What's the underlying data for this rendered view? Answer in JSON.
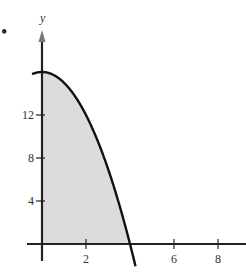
{
  "marker": "•",
  "chart_data": {
    "type": "area",
    "title": "",
    "function": "y = 16 - x^2",
    "xlabel": "",
    "ylabel": "y",
    "xlim": [
      0,
      9.2
    ],
    "ylim": [
      -1.5,
      17.5
    ],
    "x_ticks": [
      2,
      6,
      8
    ],
    "x_tick_labels": [
      "2",
      "6",
      "8"
    ],
    "y_ticks": [
      4,
      8,
      12
    ],
    "y_tick_labels": [
      "4",
      "8",
      "12"
    ],
    "grid": false,
    "shaded_region": {
      "from_x": 0,
      "to_x": 4,
      "under": "y = 16 - x^2",
      "fill": "#dcdcdc"
    },
    "x": [
      0,
      0.5,
      1,
      1.5,
      2,
      2.5,
      3,
      3.5,
      4,
      4.2
    ],
    "values": [
      16,
      15.75,
      15,
      13.75,
      12,
      9.75,
      7,
      3.75,
      0,
      -1.64
    ],
    "colors": {
      "curve": "#111111",
      "fill": "#dcdcdc",
      "axis": "#222222"
    }
  }
}
